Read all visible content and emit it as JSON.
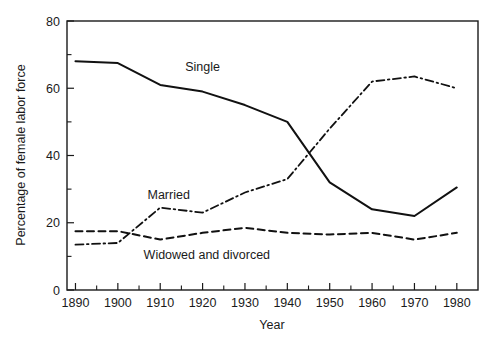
{
  "chart_data": {
    "type": "line",
    "title": "",
    "xlabel": "Year",
    "ylabel": "Percentage of female labor force",
    "x": [
      1890,
      1900,
      1910,
      1920,
      1930,
      1940,
      1950,
      1960,
      1970,
      1980
    ],
    "xlim": [
      1888,
      1985
    ],
    "ylim": [
      0,
      80
    ],
    "grid": false,
    "legend": "inline-annotations",
    "x_tick_labels": [
      "1890",
      "1900",
      "1910",
      "1920",
      "1930",
      "1940",
      "1950",
      "1960",
      "1970",
      "1980"
    ],
    "y_tick_labels": [
      "0",
      "20",
      "40",
      "60",
      "80"
    ],
    "y_ticks_major": [
      0,
      20,
      40,
      60,
      80
    ],
    "y_ticks_minor": [
      10,
      30,
      50,
      70
    ],
    "series": [
      {
        "name": "Single",
        "style": "solid",
        "color": "#111111",
        "values": [
          68,
          67.5,
          61,
          59,
          55,
          50,
          32,
          24,
          22,
          30.5
        ]
      },
      {
        "name": "Married",
        "style": "dash-dot",
        "color": "#111111",
        "values": [
          13.5,
          14,
          24.5,
          23,
          29,
          33,
          48,
          62,
          63.5,
          60
        ]
      },
      {
        "name": "Widowed and divorced",
        "style": "dashed",
        "color": "#111111",
        "values": [
          17.5,
          17.5,
          15,
          17,
          18.5,
          17,
          16.5,
          17,
          15,
          17
        ]
      }
    ],
    "annotations": [
      {
        "text": "Single",
        "x": 1920,
        "y": 66.5
      },
      {
        "text": "Married",
        "x": 1912,
        "y": 28.5
      },
      {
        "text": "Widowed and divorced",
        "x": 1921,
        "y": 10.5
      }
    ]
  }
}
